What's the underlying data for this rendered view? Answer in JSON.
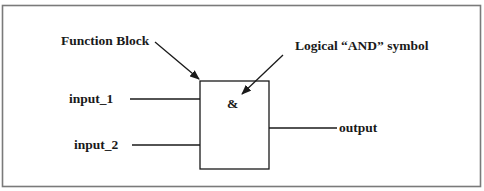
{
  "diagram": {
    "type": "logic-function-block",
    "colors": {
      "stroke": "#1a1a1a",
      "frame": "#7a7a7a",
      "background": "#ffffff"
    },
    "labels": {
      "function_block": "Function Block",
      "and_symbol_caption": "Logical “AND” symbol",
      "and_symbol": "&",
      "input_1": "input_1",
      "input_2": "input_2",
      "output": "output"
    }
  }
}
